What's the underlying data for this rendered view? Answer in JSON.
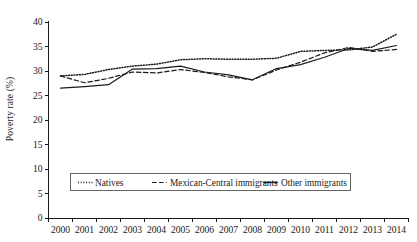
{
  "chart_data": {
    "type": "line",
    "title": "",
    "xlabel": "",
    "ylabel": "Poverty rate (%)",
    "categories": [
      "2000",
      "2001",
      "2002",
      "2003",
      "2004",
      "2005",
      "2006",
      "2007",
      "2008",
      "2009",
      "2010",
      "2011",
      "2012",
      "2013",
      "2014"
    ],
    "x": [
      2000,
      2001,
      2002,
      2003,
      2004,
      2005,
      2006,
      2007,
      2008,
      2009,
      2010,
      2011,
      2012,
      2013,
      2014
    ],
    "ylim": [
      0,
      40
    ],
    "yticks": [
      0,
      5,
      10,
      15,
      20,
      25,
      30,
      35,
      40
    ],
    "ytick_labels": [
      "0",
      "5",
      "10",
      "15",
      "20",
      "25",
      "30",
      "35",
      "40"
    ],
    "grid": false,
    "legend_position": "bottom",
    "series": [
      {
        "name": "Natives",
        "style": "dotted",
        "color": "#1a1a1a",
        "values": [
          29.0,
          29.3,
          30.3,
          31.0,
          31.4,
          32.3,
          32.5,
          32.4,
          32.4,
          32.6,
          34.0,
          34.2,
          34.3,
          34.9,
          37.5
        ]
      },
      {
        "name": "Mexican-Central immigrants",
        "style": "dashed",
        "color": "#1a1a1a",
        "values": [
          29.0,
          27.6,
          28.5,
          29.8,
          29.6,
          30.3,
          29.7,
          28.8,
          28.2,
          30.2,
          31.8,
          33.7,
          34.8,
          34.0,
          34.4
        ]
      },
      {
        "name": "Other immigrants",
        "style": "solid",
        "color": "#1a1a1a",
        "values": [
          26.5,
          26.8,
          27.2,
          30.4,
          30.5,
          31.0,
          29.8,
          29.2,
          28.2,
          30.5,
          31.3,
          32.8,
          34.6,
          34.2,
          35.2
        ]
      }
    ]
  },
  "axis": {
    "y_axis_label": "Poverty rate (%)"
  },
  "legend": {
    "items": [
      {
        "label": "Natives",
        "style": "dotted"
      },
      {
        "label": "Mexican-Central immigrants",
        "style": "dashed"
      },
      {
        "label": "Other immigrants",
        "style": "solid"
      }
    ]
  }
}
